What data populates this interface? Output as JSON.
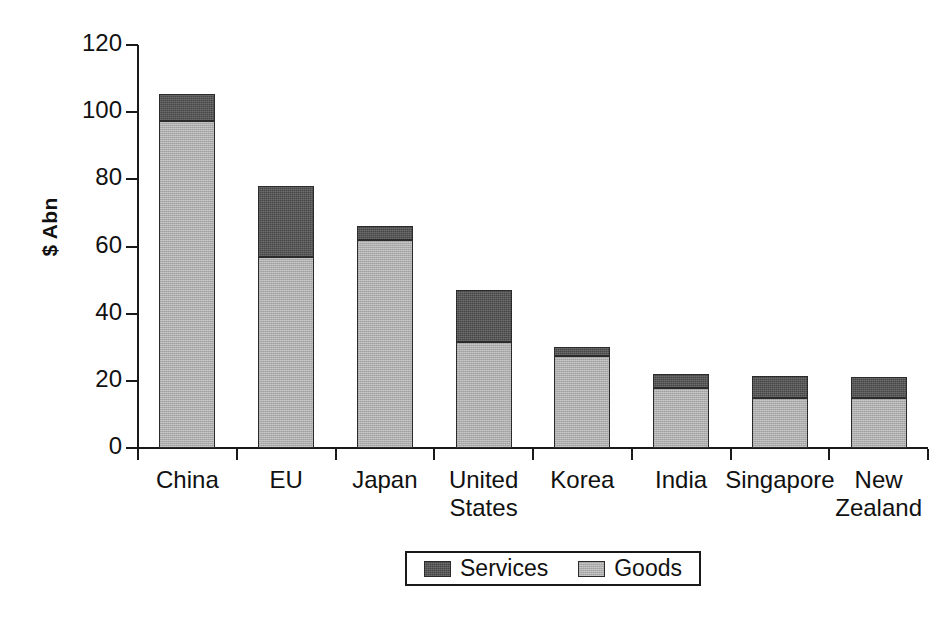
{
  "chart_data": {
    "type": "bar",
    "subtype": "stacked-vertical",
    "title": "",
    "subtitle": "",
    "xlabel": "",
    "ylabel": "$ Abn",
    "ylim": [
      0,
      120
    ],
    "ytick_step": 20,
    "yticks": [
      0,
      20,
      40,
      60,
      80,
      100,
      120
    ],
    "ytick_labels": [
      "0",
      "20",
      "40",
      "60",
      "80",
      "100",
      "120"
    ],
    "grid": false,
    "legend_position": "bottom",
    "categories": [
      "China",
      "EU",
      "Japan",
      "United\nStates",
      "Korea",
      "India",
      "Singapore",
      "New\nZealand"
    ],
    "series": [
      {
        "name": "Goods",
        "color": "#adadad",
        "values": [
          97.5,
          57.0,
          62.0,
          31.5,
          27.5,
          18.0,
          15.0,
          14.8
        ]
      },
      {
        "name": "Services",
        "color": "#464646",
        "values": [
          8.0,
          21.0,
          4.0,
          15.5,
          2.5,
          4.0,
          6.5,
          6.2
        ]
      }
    ],
    "totals": [
      105.5,
      78.0,
      66.0,
      47.0,
      30.0,
      22.0,
      21.5,
      21.0
    ],
    "stack_order_bottom_to_top": [
      "Goods",
      "Services"
    ]
  },
  "legend": {
    "items": [
      {
        "label": "Services",
        "color": "#464646"
      },
      {
        "label": "Goods",
        "color": "#adadad"
      }
    ]
  },
  "axis": {
    "y_title": "$ Abn"
  },
  "colors": {
    "goods": "#adadad",
    "services": "#464646",
    "axis": "#1a1a1a",
    "text": "#111111",
    "background": "#ffffff"
  }
}
